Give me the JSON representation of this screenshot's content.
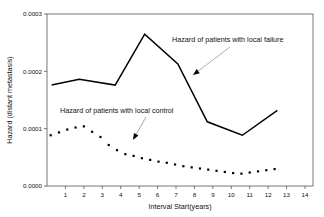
{
  "chart_data": {
    "type": "line",
    "title": "",
    "xlabel": "Interval Start(years)",
    "ylabel": "Hazard (distant metastasis)",
    "xlim": [
      0,
      14
    ],
    "ylim": [
      0.0,
      0.0003
    ],
    "xticks": [
      1,
      2,
      3,
      4,
      5,
      6,
      7,
      8,
      9,
      10,
      11,
      12,
      13,
      14
    ],
    "xtick_labels": [
      "1",
      "2",
      "3",
      "4",
      "5",
      "6",
      "7",
      "8",
      "9",
      "10",
      "11",
      "12",
      "13",
      "14"
    ],
    "yticks": [
      0.0,
      0.0001,
      0.0002,
      0.0003
    ],
    "ytick_labels": [
      "0.0000",
      "0.0001",
      "0.0002",
      "0.0003"
    ],
    "grid": false,
    "legend": "annotations",
    "series": [
      {
        "name": "Hazard of patients with local failure",
        "style": "solid-line",
        "x": [
          0.25,
          1.75,
          3.7,
          5.3,
          7.1,
          8.7,
          10.6,
          12.5
        ],
        "values": [
          0.000176,
          0.000186,
          0.000176,
          0.000265,
          0.000213,
          0.000112,
          8.85e-05,
          0.000132
        ]
      },
      {
        "name": "Hazard of patients with local control",
        "style": "dotted-markers",
        "x": [
          0.2,
          0.65,
          1.1,
          1.55,
          2.0,
          2.45,
          2.9,
          3.35,
          3.8,
          4.25,
          4.7,
          5.15,
          5.6,
          6.05,
          6.5,
          6.95,
          7.4,
          7.85,
          8.3,
          8.75,
          9.2,
          9.65,
          10.1,
          10.55,
          11.0,
          11.45,
          11.9,
          12.35
        ],
        "values": [
          8.85e-05,
          9.35e-05,
          9.85e-05,
          0.000102,
          0.000104,
          9.45e-05,
          8.55e-05,
          7.15e-05,
          6.25e-05,
          5.55e-05,
          5.25e-05,
          4.85e-05,
          4.55e-05,
          4.25e-05,
          4.05e-05,
          3.75e-05,
          3.45e-05,
          3.25e-05,
          3.05e-05,
          2.85e-05,
          2.65e-05,
          2.45e-05,
          2.25e-05,
          2.15e-05,
          2.35e-05,
          2.55e-05,
          2.75e-05,
          2.95e-05
        ]
      }
    ],
    "annotations": [
      {
        "text": "Hazard of patients with local failure",
        "text_x": 172,
        "text_y": 42,
        "leader_from_x": 230,
        "leader_from_y": 47,
        "leader_to_x": 193,
        "leader_to_y": 75
      },
      {
        "text": "Hazard of patients with local control",
        "text_x": 60,
        "text_y": 113,
        "leader_from_x": 146,
        "leader_from_y": 117,
        "leader_to_x": 133,
        "leader_to_y": 140
      }
    ],
    "colors": {
      "line": "#000000",
      "marker": "#000000",
      "frame": "#555555",
      "leader": "#8a8a8a",
      "background": "#ffffff"
    }
  }
}
